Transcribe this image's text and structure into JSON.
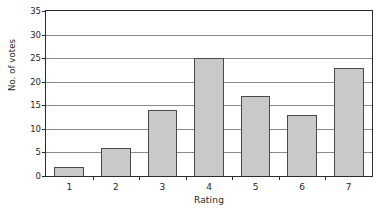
{
  "chart_data": {
    "type": "bar",
    "title": "",
    "subtitle": "",
    "xlabel": "Rating",
    "ylabel": "No. of votes",
    "categories": [
      "1",
      "2",
      "3",
      "4",
      "5",
      "6",
      "7"
    ],
    "values": [
      2,
      6,
      14,
      25,
      17,
      13,
      23
    ],
    "ylim": [
      0,
      35
    ],
    "ytick_labels": [
      "0",
      "5",
      "10",
      "15",
      "20",
      "25",
      "30",
      "35"
    ],
    "ytick_values": [
      0,
      5,
      10,
      15,
      20,
      25,
      30,
      35
    ],
    "grid": true,
    "grid_axis": "y",
    "legend": false,
    "legend_position": "none",
    "annotations": [],
    "colors": {
      "bar_fill": "#c9c9c9",
      "bar_border": "#4a4a4a",
      "gridline": "#8a8a8a",
      "axis": "#2b2b2b",
      "background": "#ffffff",
      "text": "#1f1f1f"
    }
  }
}
